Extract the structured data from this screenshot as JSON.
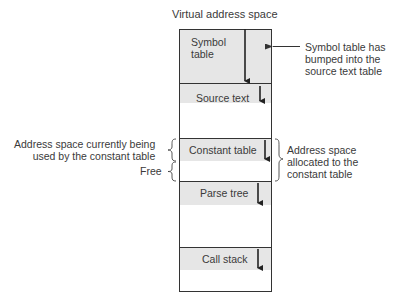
{
  "title": "Virtual address space",
  "segments": [
    {
      "id": "symbol-table",
      "label": "Symbol\ntable",
      "label_line1": "Symbol",
      "label_line2": "table"
    },
    {
      "id": "source-text",
      "label": "Source text"
    },
    {
      "id": "constant-table",
      "label": "Constant table"
    },
    {
      "id": "parse-tree",
      "label": "Parse tree"
    },
    {
      "id": "call-stack",
      "label": "Call stack"
    }
  ],
  "annotations": {
    "symbol_bumped": [
      "Symbol table has",
      "bumped into the",
      "source text table"
    ],
    "constant_used": [
      "Address space currently being",
      "used by the constant table"
    ],
    "free": "Free",
    "constant_allocated": [
      "Address space",
      "allocated to the",
      "constant table"
    ]
  }
}
